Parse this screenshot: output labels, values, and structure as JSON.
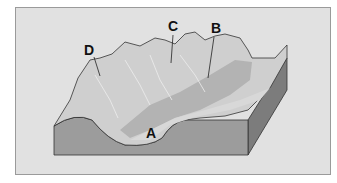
{
  "figure": {
    "labels": [
      {
        "id": "A",
        "text": "A"
      },
      {
        "id": "B",
        "text": "B"
      },
      {
        "id": "C",
        "text": "C"
      },
      {
        "id": "D",
        "text": "D"
      }
    ],
    "colors": {
      "background": "#e1e1e1",
      "front_face": "#9c9c9c",
      "side_face": "#7c7c7c",
      "terrain_light": "#cfcfcf",
      "terrain_mid": "#b3b3b3",
      "valley_floor": "#c9c9c9",
      "outline": "#333333"
    }
  }
}
